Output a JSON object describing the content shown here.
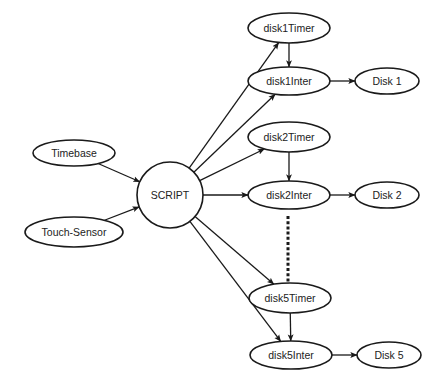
{
  "diagram": {
    "colors": {
      "stroke": "#1a1a1a",
      "fill": "#ffffff",
      "text": "#222222"
    },
    "nodes": {
      "timebase": {
        "label": "Timebase",
        "shape": "ellipse",
        "cx": 74,
        "cy": 153,
        "rx": 41,
        "ry": 13
      },
      "touchSensor": {
        "label": "Touch-Sensor",
        "shape": "ellipse",
        "cx": 74,
        "cy": 232,
        "rx": 49,
        "ry": 15
      },
      "script": {
        "label": "SCRIPT",
        "shape": "circle",
        "cx": 170,
        "cy": 195,
        "r": 33
      },
      "disk1Timer": {
        "label": "disk1Timer",
        "shape": "ellipse",
        "cx": 289,
        "cy": 28,
        "rx": 41,
        "ry": 15
      },
      "disk1Inter": {
        "label": "disk1Inter",
        "shape": "ellipse",
        "cx": 289,
        "cy": 81,
        "rx": 41,
        "ry": 14
      },
      "disk1": {
        "label": "Disk 1",
        "shape": "ellipse",
        "cx": 387,
        "cy": 81,
        "rx": 32,
        "ry": 13
      },
      "disk2Timer": {
        "label": "disk2Timer",
        "shape": "ellipse",
        "cx": 289,
        "cy": 137,
        "rx": 41,
        "ry": 15
      },
      "disk2Inter": {
        "label": "disk2Inter",
        "shape": "ellipse",
        "cx": 289,
        "cy": 195,
        "rx": 41,
        "ry": 14
      },
      "disk2": {
        "label": "Disk 2",
        "shape": "ellipse",
        "cx": 387,
        "cy": 195,
        "rx": 32,
        "ry": 13
      },
      "disk5Timer": {
        "label": "disk5Timer",
        "shape": "ellipse",
        "cx": 290,
        "cy": 298,
        "rx": 41,
        "ry": 15
      },
      "disk5Inter": {
        "label": "disk5Inter",
        "shape": "ellipse",
        "cx": 291,
        "cy": 355,
        "rx": 41,
        "ry": 14
      },
      "disk5": {
        "label": "Disk 5",
        "shape": "ellipse",
        "cx": 389,
        "cy": 355,
        "rx": 32,
        "ry": 13
      }
    },
    "edges": [
      {
        "from": "timebase",
        "to": "script"
      },
      {
        "from": "touchSensor",
        "to": "script"
      },
      {
        "from": "script",
        "to": "disk1Timer"
      },
      {
        "from": "script",
        "to": "disk1Inter"
      },
      {
        "from": "script",
        "to": "disk2Timer"
      },
      {
        "from": "script",
        "to": "disk2Inter"
      },
      {
        "from": "script",
        "to": "disk5Timer"
      },
      {
        "from": "script",
        "to": "disk5Inter"
      },
      {
        "from": "disk1Timer",
        "to": "disk1Inter"
      },
      {
        "from": "disk1Inter",
        "to": "disk1"
      },
      {
        "from": "disk2Timer",
        "to": "disk2Inter"
      },
      {
        "from": "disk2Inter",
        "to": "disk2"
      },
      {
        "from": "disk5Timer",
        "to": "disk5Inter"
      },
      {
        "from": "disk5Inter",
        "to": "disk5"
      }
    ],
    "ellipsis": {
      "x": 288,
      "y1": 216,
      "y2": 290,
      "meaning": "disks 3-4 omitted"
    }
  }
}
